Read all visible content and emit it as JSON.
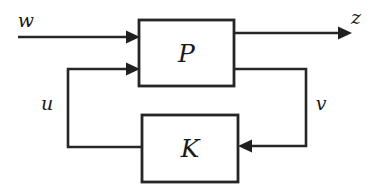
{
  "diagram": {
    "canvas": {
      "width": 376,
      "height": 190,
      "background": "#ffffff"
    },
    "stroke_color": "#262626",
    "text_color": "#1a1a1a",
    "blocks": [
      {
        "id": "plant",
        "label": "P",
        "x": 139,
        "y": 20,
        "width": 95,
        "height": 66
      },
      {
        "id": "controller",
        "label": "K",
        "x": 142,
        "y": 115,
        "width": 96,
        "height": 67
      }
    ],
    "signals": [
      {
        "id": "w",
        "label": "w",
        "label_x": 26,
        "label_y": 20,
        "description": "exogenous input into P"
      },
      {
        "id": "z",
        "label": "z",
        "label_x": 356,
        "label_y": 17,
        "description": "regulated output from P"
      },
      {
        "id": "u",
        "label": "u",
        "label_x": 47,
        "label_y": 103,
        "description": "control signal from K into P"
      },
      {
        "id": "v",
        "label": "v",
        "label_x": 321,
        "label_y": 103,
        "description": "measurement from P into K"
      }
    ],
    "geometry": {
      "w_line": "M18,37 L126,37",
      "w_arrow": "M126,30.5 L140,37 L126,43.5 Z",
      "z_line": "M234,33 L340,33",
      "z_arrow": "M338,26.5 L352,33 L338,39.5 Z",
      "u_line": "M126,69 L68,69 L68,147 L142,147",
      "u_arrow": "M126,62.5 L140,69 L126,75.5 Z",
      "v_line": "M234,69 L306,69 L306,146 L252,146",
      "v_arrow": "M252,139.5 L238,146 L252,152.5 Z"
    }
  }
}
